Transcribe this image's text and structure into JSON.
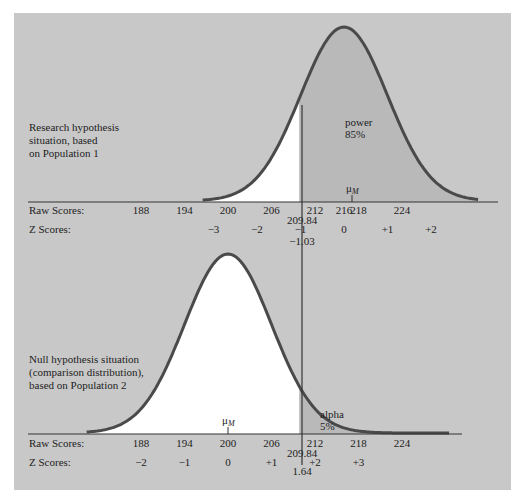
{
  "colors": {
    "panel_bg": "#c8c8c8",
    "curve": "#4a4a4a",
    "shaded": "#b9b9b9",
    "unshaded": "#ffffff",
    "axis": "#333333"
  },
  "chart_data": [
    {
      "type": "area",
      "title": "Research hypothesis situation, based on Population 1",
      "description_lines": [
        "Research hypothesis",
        "situation, based",
        "on Population 1"
      ],
      "distribution": "normal",
      "mean": 216,
      "sd_of_means": 6,
      "mean_label": "μM",
      "cutoff_raw": 209.84,
      "cutoff_z": -1.03,
      "cutoff_raw_label": "209.84",
      "cutoff_z_label": "−1.03",
      "shaded_region": "right of cutoff",
      "shaded_label": [
        "power",
        "85%"
      ],
      "shaded_percent": 85,
      "raw_axis_label": "Raw Scores:",
      "z_axis_label": "Z Scores:",
      "raw_ticks": [
        188,
        194,
        200,
        206,
        212,
        216,
        218,
        224
      ],
      "raw_tick_labels": [
        "188",
        "194",
        "200",
        "206",
        "212",
        "216",
        "218",
        "224"
      ],
      "z_ticks": [
        -3,
        -2,
        -1,
        0,
        1,
        2
      ],
      "z_tick_labels": [
        "−3",
        "−2",
        "−1",
        "0",
        "+1",
        "+2"
      ],
      "z_tick_raw_positions": [
        198,
        204,
        210,
        216,
        222,
        228
      ]
    },
    {
      "type": "area",
      "title": "Null hypothesis situation (comparison distribution), based on Population 2",
      "description_lines": [
        "Null hypothesis situation",
        "(comparison distribution),",
        "based on Population 2"
      ],
      "distribution": "normal",
      "mean": 200,
      "sd_of_means": 6,
      "mean_label": "μM",
      "cutoff_raw": 209.84,
      "cutoff_z": 1.64,
      "cutoff_raw_label": "209.84",
      "cutoff_z_label": "1.64",
      "shaded_region": "right of cutoff",
      "shaded_label": [
        "alpha",
        "5%"
      ],
      "shaded_percent": 5,
      "raw_axis_label": "Raw Scores:",
      "z_axis_label": "Z Scores:",
      "raw_ticks": [
        188,
        194,
        200,
        206,
        212,
        218,
        224
      ],
      "raw_tick_labels": [
        "188",
        "194",
        "200",
        "206",
        "212",
        "218",
        "224"
      ],
      "z_ticks": [
        -2,
        -1,
        0,
        1,
        2,
        3
      ],
      "z_tick_labels": [
        "−2",
        "−1",
        "0",
        "+1",
        "+2",
        "+3"
      ],
      "z_tick_raw_positions": [
        188,
        194,
        200,
        206,
        212,
        218
      ]
    }
  ]
}
